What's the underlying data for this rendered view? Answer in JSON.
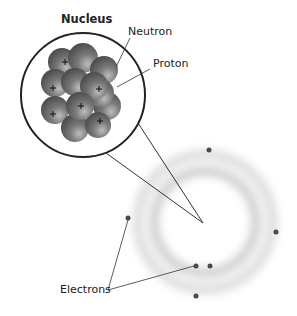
{
  "labels": {
    "nucleus": "Nucleus",
    "neutron": "Neutron",
    "proton": "Proton",
    "electrons": "Electrons"
  },
  "diagram": {
    "nucleus_particles": {
      "protons_marked": 7,
      "symbol": "+"
    },
    "electron_count": 6,
    "colors": {
      "particle": "#6f6f6f",
      "line": "#333333",
      "cloud": "#cfcfcf",
      "electron": "#4a4a4a"
    }
  }
}
